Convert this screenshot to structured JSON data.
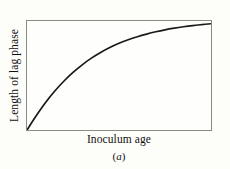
{
  "figure": {
    "panel_label_open": "(",
    "panel_label_letter": "a",
    "panel_label_close": ")",
    "background_color": "#fdfdfa",
    "frame_color": "#8a8a85",
    "curve_color": "#1a1a1a"
  },
  "chart_data": {
    "type": "line",
    "title": "",
    "subtitle": "",
    "xlabel": "Inoculum age",
    "ylabel": "Length of lag phase",
    "annotations": [
      "(a)"
    ],
    "legend": [],
    "legend_position": "none",
    "grid": false,
    "axis_ticks": false,
    "tick_labels": {
      "x": [],
      "y": []
    },
    "xlim": [
      0,
      1
    ],
    "ylim": [
      0,
      1
    ],
    "series": [
      {
        "name": "Length of lag phase vs inoculum age",
        "color": "#1a1a1a",
        "x": [
          0.0,
          0.05,
          0.1,
          0.15,
          0.2,
          0.25,
          0.3,
          0.35,
          0.4,
          0.45,
          0.5,
          0.55,
          0.6,
          0.65,
          0.7,
          0.75,
          0.8,
          0.85,
          0.9,
          0.95,
          1.0
        ],
        "y": [
          0.0,
          0.13,
          0.25,
          0.355,
          0.447,
          0.528,
          0.598,
          0.659,
          0.711,
          0.756,
          0.795,
          0.828,
          0.856,
          0.88,
          0.901,
          0.919,
          0.934,
          0.947,
          0.958,
          0.967,
          0.975
        ]
      }
    ]
  }
}
